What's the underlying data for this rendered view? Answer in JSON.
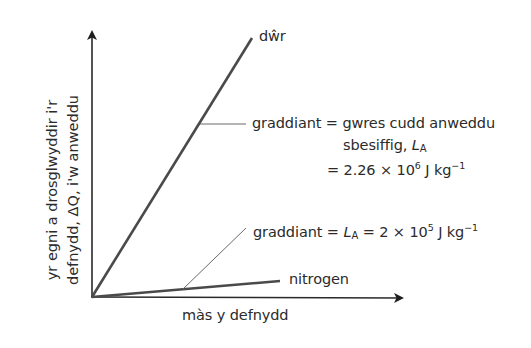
{
  "diagram": {
    "y_axis": {
      "label_line1": "yr egni a drosglwyddir i'r",
      "label_line2": "defnydd, ΔQ, i'w anweddu"
    },
    "x_axis": {
      "label": "màs y defnydd"
    },
    "lines": [
      {
        "name": "dŵr",
        "label": "dŵr"
      },
      {
        "name": "nitrogen",
        "label": "nitrogen"
      }
    ],
    "annotations": {
      "water": {
        "line1": "graddiant = gwres cudd anweddu",
        "line2_text": "sbesiffig, ",
        "line2_symbol": "L",
        "line2_sub": "A",
        "line3_prefix": "= 2.26 × 10",
        "line3_exp": "6",
        "line3_unit": " J kg",
        "line3_unit_exp": "−1"
      },
      "nitrogen": {
        "prefix": "graddiant = ",
        "symbol": "L",
        "sub": "A",
        "middle": " = 2 × 10",
        "exp": "5",
        "unit": " J kg",
        "unit_exp": "−1"
      }
    },
    "colors": {
      "line": "#4a4a4a",
      "axis": "#2a2a2a",
      "leader": "#6a6a6a",
      "text": "#2b2b2b"
    }
  }
}
